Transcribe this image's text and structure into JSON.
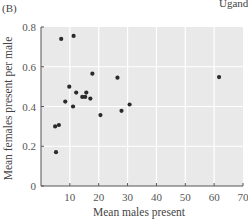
{
  "panel_label": "(B)",
  "corner_label": "Uganda",
  "chart_data": {
    "type": "scatter",
    "title": "",
    "xlabel": "Mean males present",
    "ylabel": "Mean females present per male",
    "xlim": [
      0,
      70
    ],
    "ylim": [
      0,
      0.8
    ],
    "xticks": [
      10,
      20,
      30,
      40,
      50,
      60,
      70
    ],
    "xtick_labels": [
      "10",
      "20",
      "30",
      "40",
      "50",
      "60",
      "70"
    ],
    "yticks": [
      0,
      0.2,
      0.4,
      0.6,
      0.8
    ],
    "ytick_labels": [
      "0",
      "0.2",
      "0.4",
      "0.6",
      "0.8"
    ],
    "grid": true,
    "background_color": "#e9e9e9",
    "point_color": "#2a2a2a",
    "series": [
      {
        "name": "groups",
        "points": [
          {
            "x": 7.0,
            "y": 0.74
          },
          {
            "x": 11.3,
            "y": 0.755
          },
          {
            "x": 17.8,
            "y": 0.565
          },
          {
            "x": 26.5,
            "y": 0.545
          },
          {
            "x": 61.7,
            "y": 0.548
          },
          {
            "x": 9.8,
            "y": 0.5
          },
          {
            "x": 12.2,
            "y": 0.47
          },
          {
            "x": 15.7,
            "y": 0.47
          },
          {
            "x": 14.3,
            "y": 0.448
          },
          {
            "x": 15.3,
            "y": 0.448
          },
          {
            "x": 17.1,
            "y": 0.44
          },
          {
            "x": 8.4,
            "y": 0.425
          },
          {
            "x": 11.1,
            "y": 0.4
          },
          {
            "x": 30.7,
            "y": 0.41
          },
          {
            "x": 27.9,
            "y": 0.378
          },
          {
            "x": 20.6,
            "y": 0.357
          },
          {
            "x": 6.2,
            "y": 0.307
          },
          {
            "x": 4.9,
            "y": 0.3
          },
          {
            "x": 5.2,
            "y": 0.17
          }
        ]
      }
    ]
  }
}
